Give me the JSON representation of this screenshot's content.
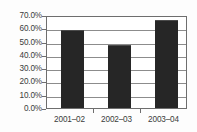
{
  "chart_data": {
    "type": "bar",
    "title": "",
    "subtitle": "",
    "xlabel": "",
    "ylabel": "",
    "categories": [
      "2001–02",
      "2002–03",
      "2003–04"
    ],
    "values": [
      58.7,
      47.4,
      66.2
    ],
    "series": [
      {
        "name": "",
        "values": [
          58.7,
          47.4,
          66.2
        ]
      }
    ],
    "ylim": [
      0,
      70
    ],
    "ytick_values": [
      0,
      10,
      20,
      30,
      40,
      50,
      60,
      70
    ],
    "ytick_labels": [
      "0.0%",
      "10.0%",
      "20.0%",
      "30.0%",
      "40.0%",
      "50.0%",
      "60.0%",
      "70.0%"
    ],
    "xtick_labels": [
      "2001–02",
      "2002–03",
      "2003–04"
    ],
    "grid": true,
    "grid_axis": "y",
    "legend": false,
    "legend_position": "none",
    "annotations": [],
    "colors": {
      "bar_fill": "#262626",
      "gridline": "#8c8c8c",
      "axis": "#6e6e6e",
      "text": "#3b3b3b",
      "plot_background": "#ffffff",
      "figure_background": "#fdfdfd"
    }
  }
}
